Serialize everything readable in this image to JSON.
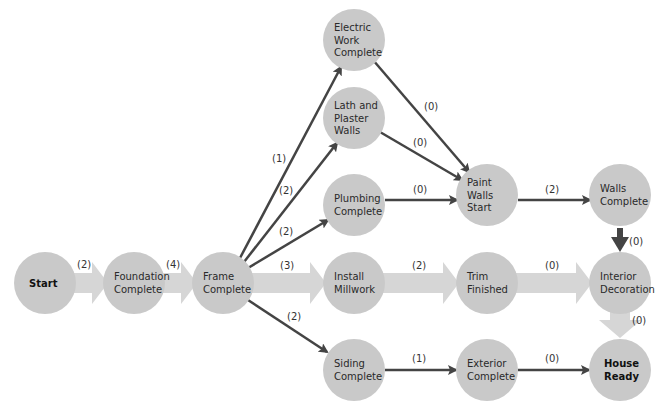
{
  "colors": {
    "node_fill": "#c9c9c9",
    "thin_arrow": "#444444",
    "thick_arrow": "#d6d6d6",
    "background": "#ffffff"
  },
  "nodes": [
    {
      "id": "start",
      "lines": [
        "Start"
      ],
      "bold": true,
      "cx": 45,
      "cy": 283
    },
    {
      "id": "foundation",
      "lines": [
        "Foundation",
        "Complete"
      ],
      "bold": false,
      "cx": 134,
      "cy": 283
    },
    {
      "id": "frame",
      "lines": [
        "Frame",
        "Complete"
      ],
      "bold": false,
      "cx": 223,
      "cy": 283
    },
    {
      "id": "electric",
      "lines": [
        "Electric",
        "Work",
        "Complete"
      ],
      "bold": false,
      "cx": 354,
      "cy": 40
    },
    {
      "id": "lath",
      "lines": [
        "Lath and",
        "Plaster",
        "Walls"
      ],
      "bold": false,
      "cx": 354,
      "cy": 118
    },
    {
      "id": "plumbing",
      "lines": [
        "Plumbing",
        "Complete"
      ],
      "bold": false,
      "cx": 354,
      "cy": 205
    },
    {
      "id": "millwork",
      "lines": [
        "Install",
        "Millwork"
      ],
      "bold": false,
      "cx": 354,
      "cy": 283
    },
    {
      "id": "siding",
      "lines": [
        "Siding",
        "Complete"
      ],
      "bold": false,
      "cx": 354,
      "cy": 370
    },
    {
      "id": "paint",
      "lines": [
        "Paint",
        "Walls",
        "Start"
      ],
      "bold": false,
      "cx": 487,
      "cy": 195
    },
    {
      "id": "trim",
      "lines": [
        "Trim",
        "Finished"
      ],
      "bold": false,
      "cx": 487,
      "cy": 283
    },
    {
      "id": "exterior",
      "lines": [
        "Exterior",
        "Complete"
      ],
      "bold": false,
      "cx": 487,
      "cy": 370
    },
    {
      "id": "walls",
      "lines": [
        "Walls",
        "Complete"
      ],
      "bold": false,
      "cx": 620,
      "cy": 195
    },
    {
      "id": "interior",
      "lines": [
        "Interior",
        "Decoration"
      ],
      "bold": false,
      "cx": 620,
      "cy": 283
    },
    {
      "id": "house",
      "lines": [
        "House",
        "Ready"
      ],
      "bold": true,
      "cx": 620,
      "cy": 370
    }
  ],
  "edges": [
    {
      "from": "start",
      "to": "foundation",
      "label": "(2)",
      "style": "thick"
    },
    {
      "from": "foundation",
      "to": "frame",
      "label": "(4)",
      "style": "thick"
    },
    {
      "from": "frame",
      "to": "electric",
      "label": "(1)",
      "style": "thin"
    },
    {
      "from": "frame",
      "to": "lath",
      "label": "(2)",
      "style": "thin"
    },
    {
      "from": "frame",
      "to": "plumbing",
      "label": "(2)",
      "style": "thin"
    },
    {
      "from": "frame",
      "to": "millwork",
      "label": "(3)",
      "style": "thick"
    },
    {
      "from": "frame",
      "to": "siding",
      "label": "(2)",
      "style": "thin"
    },
    {
      "from": "electric",
      "to": "paint",
      "label": "(0)",
      "style": "thin"
    },
    {
      "from": "lath",
      "to": "paint",
      "label": "(0)",
      "style": "thin"
    },
    {
      "from": "plumbing",
      "to": "paint",
      "label": "(0)",
      "style": "thin"
    },
    {
      "from": "paint",
      "to": "walls",
      "label": "(2)",
      "style": "thin"
    },
    {
      "from": "millwork",
      "to": "trim",
      "label": "(2)",
      "style": "thick"
    },
    {
      "from": "trim",
      "to": "interior",
      "label": "(0)",
      "style": "thick"
    },
    {
      "from": "walls",
      "to": "interior",
      "label": "(0)",
      "style": "thin"
    },
    {
      "from": "interior",
      "to": "house",
      "label": "(0)",
      "style": "thick"
    },
    {
      "from": "siding",
      "to": "exterior",
      "label": "(1)",
      "style": "thin"
    },
    {
      "from": "exterior",
      "to": "house",
      "label": "(0)",
      "style": "thin"
    }
  ],
  "edge_labels": {
    "start_foundation": "(2)",
    "foundation_frame": "(4)",
    "frame_electric": "(1)",
    "frame_lath": "(2)",
    "frame_plumbing": "(2)",
    "frame_millwork": "(3)",
    "frame_siding": "(2)",
    "electric_paint": "(0)",
    "lath_paint": "(0)",
    "plumbing_paint": "(0)",
    "paint_walls": "(2)",
    "millwork_trim": "(2)",
    "trim_interior": "(0)",
    "walls_interior": "(0)",
    "interior_house": "(0)",
    "siding_exterior": "(1)",
    "exterior_house": "(0)"
  },
  "node_text": {
    "start": [
      "Start"
    ],
    "foundation": [
      "Foundation",
      "Complete"
    ],
    "frame": [
      "Frame",
      "Complete"
    ],
    "electric": [
      "Electric",
      "Work",
      "Complete"
    ],
    "lath": [
      "Lath and",
      "Plaster",
      "Walls"
    ],
    "plumbing": [
      "Plumbing",
      "Complete"
    ],
    "millwork": [
      "Install",
      "Millwork"
    ],
    "siding": [
      "Siding",
      "Complete"
    ],
    "paint": [
      "Paint",
      "Walls",
      "Start"
    ],
    "trim": [
      "Trim",
      "Finished"
    ],
    "exterior": [
      "Exterior",
      "Complete"
    ],
    "walls": [
      "Walls",
      "Complete"
    ],
    "interior": [
      "Interior",
      "Decoration"
    ],
    "house": [
      "House",
      "Ready"
    ]
  }
}
